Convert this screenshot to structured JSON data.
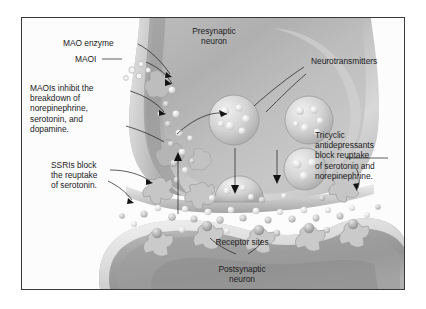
{
  "figure": {
    "style": "grayscale medical illustration with thin black rectangular frame",
    "frame_color": "#3a3a3c",
    "background_color": "#ffffff"
  },
  "labels": {
    "mao_enzyme": "MAO enzyme",
    "maoi": "MAOI",
    "maoi_action": "MAOIs inhibit the\nbreakdown of\nnorepinephrine,\nserotonin, and\ndopamine.",
    "ssri_action": "SSRIs block\nthe reuptake\nof serotonin.",
    "presynaptic_neuron": "Presynaptic\nneuron",
    "neurotransmitters": "Neurotransmitters",
    "tricyclic_action": "Tricyclic\nantidepressants\nblock reuptake\nof serotonin and\nnorepinephrine.",
    "receptor_sites": "Receptor sites",
    "postsynaptic_neuron": "Postsynaptic\nneuron"
  },
  "diagram_parts": [
    "presynaptic neuron terminal",
    "postsynaptic neuron",
    "synaptic cleft",
    "synaptic vesicles containing neurotransmitters",
    "neurotransmitter molecules",
    "receptor sites on postsynaptic membrane",
    "reuptake transporter proteins",
    "MAO enzyme",
    "MAOI molecules"
  ],
  "colors": {
    "neuron_light": "#d9d9d9",
    "neuron_mid": "#b4b4b4",
    "neuron_dark": "#8f8f8f",
    "vesicle": "#cfcfcf",
    "molecule": "#e8e8e8",
    "text": "#1b1b1d",
    "leader_line": "#1a1a1c"
  }
}
